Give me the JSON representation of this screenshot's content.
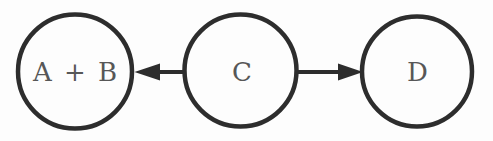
{
  "diagram": {
    "kind": "directed-graph",
    "background_color": "#fdfdfd",
    "stroke_color": "#2d2d2d",
    "label_color": "#575757",
    "nodes": [
      {
        "id": "ab",
        "label": "A + B"
      },
      {
        "id": "c",
        "label": "C"
      },
      {
        "id": "d",
        "label": "D"
      }
    ],
    "edges": [
      {
        "from": "C",
        "to": "A + B",
        "direction": "left",
        "style": "solid-arrow"
      },
      {
        "from": "C",
        "to": "D",
        "direction": "right",
        "style": "solid-arrow"
      }
    ]
  }
}
